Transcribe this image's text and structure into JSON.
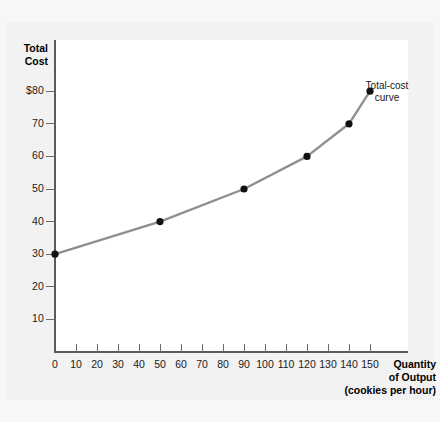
{
  "chart_data": {
    "type": "line",
    "title": "",
    "xlabel": "Quantity of Output (cookies per hour)",
    "ylabel": "Total Cost",
    "xlabel_lines": [
      "Quantity",
      "of Output",
      "(cookies per hour)"
    ],
    "ylabel_lines": [
      "Total",
      "Cost"
    ],
    "x": [
      0,
      50,
      90,
      120,
      140,
      150
    ],
    "y": [
      30,
      40,
      50,
      60,
      70,
      80
    ],
    "series": [
      {
        "name": "Total-cost curve",
        "points": [
          {
            "x": 0,
            "y": 30
          },
          {
            "x": 50,
            "y": 40
          },
          {
            "x": 90,
            "y": 50
          },
          {
            "x": 120,
            "y": 60
          },
          {
            "x": 140,
            "y": 70
          },
          {
            "x": 150,
            "y": 80
          }
        ]
      }
    ],
    "annotation_lines": [
      "Total-cost",
      "curve"
    ],
    "xlim": [
      0,
      160
    ],
    "ylim": [
      0,
      85
    ],
    "xticks": [
      0,
      10,
      20,
      30,
      40,
      50,
      60,
      70,
      80,
      90,
      100,
      110,
      120,
      130,
      140,
      150
    ],
    "xtick_labels": [
      "0",
      "10",
      "20",
      "30",
      "40",
      "50",
      "60",
      "70",
      "80",
      "90",
      "100",
      "110",
      "120",
      "130",
      "140",
      "150"
    ],
    "yticks": [
      10,
      20,
      30,
      40,
      50,
      60,
      70,
      80
    ],
    "ytick_labels": [
      "10",
      "20",
      "30",
      "40",
      "50",
      "60",
      "70",
      "$80"
    ],
    "grid": false,
    "legend_position": "none",
    "line_color": "#8f8f8f",
    "marker_color": "#111111",
    "axis_color": "#5a5a5a",
    "plot_background": "#ffffff",
    "page_background": "#f2f2f2"
  }
}
